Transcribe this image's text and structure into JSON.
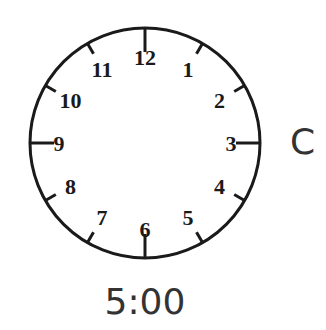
{
  "clock": {
    "numerals": [
      "12",
      "1",
      "2",
      "3",
      "4",
      "5",
      "6",
      "7",
      "8",
      "9",
      "10",
      "11"
    ],
    "hands": "none",
    "stroke_color": "#1a1a1a"
  },
  "option_label": "C",
  "time_label": "5:00"
}
